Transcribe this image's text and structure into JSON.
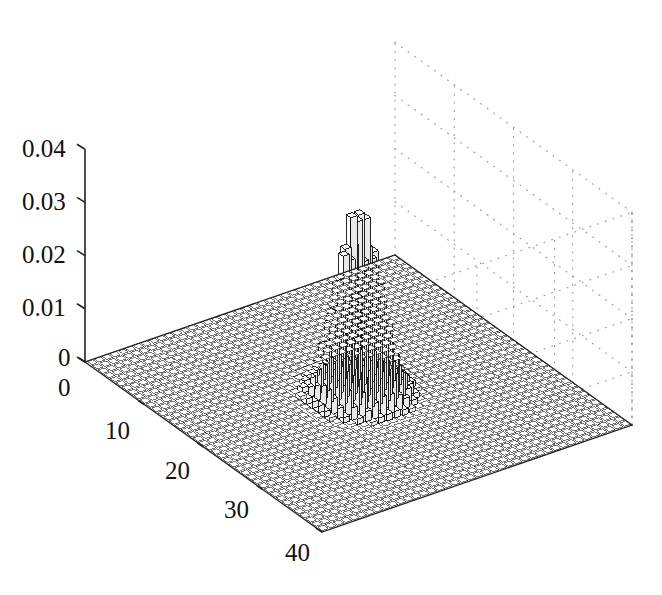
{
  "figure": {
    "type": "3d-bar-plot",
    "background_color": "#ffffff",
    "bar_face_color": "#ffffff",
    "bar_edge_color": "#000000",
    "grid_color": "#9a9a9a",
    "axis_color": "#222222"
  },
  "axes": {
    "z": {
      "ticks": [
        "0",
        "0.01",
        "0.02",
        "0.03",
        "0.04"
      ],
      "tick_values": [
        0,
        0.01,
        0.02,
        0.03,
        0.04
      ],
      "range": [
        0,
        0.04
      ]
    },
    "x": {
      "ticks": [
        "0",
        "10",
        "20",
        "30",
        "40"
      ],
      "tick_values": [
        0,
        10,
        20,
        30,
        40
      ],
      "range": [
        0,
        40
      ]
    },
    "y": {
      "ticks": [],
      "range": [
        0,
        40
      ]
    }
  },
  "labels": {
    "z_0": "0",
    "z_001": "0.01",
    "z_002": "0.02",
    "z_003": "0.03",
    "z_004": "0.04",
    "x_0": "0",
    "x_10": "10",
    "x_20": "20",
    "x_30": "30",
    "x_40": "40"
  },
  "chart_data": {
    "type": "bar",
    "subtype": "bar3-surface",
    "title": "",
    "xlabel": "",
    "ylabel": "",
    "zlabel": "",
    "grid": true,
    "legend": null,
    "xlim": [
      0,
      40
    ],
    "ylim": [
      0,
      40
    ],
    "zlim": [
      0,
      0.04
    ],
    "grid_size": [
      40,
      40
    ],
    "peak": {
      "x": 20,
      "y": 20,
      "value": 0.0352
    },
    "distribution": "gaussian-peak",
    "sigma": 2.1,
    "baseline": 0.00012,
    "categories_x": [
      1,
      2,
      3,
      4,
      5,
      6,
      7,
      8,
      9,
      10,
      11,
      12,
      13,
      14,
      15,
      16,
      17,
      18,
      19,
      20,
      21,
      22,
      23,
      24,
      25,
      26,
      27,
      28,
      29,
      30,
      31,
      32,
      33,
      34,
      35,
      36,
      37,
      38,
      39,
      40
    ],
    "categories_y": [
      1,
      2,
      3,
      4,
      5,
      6,
      7,
      8,
      9,
      10,
      11,
      12,
      13,
      14,
      15,
      16,
      17,
      18,
      19,
      20,
      21,
      22,
      23,
      24,
      25,
      26,
      27,
      28,
      29,
      30,
      31,
      32,
      33,
      34,
      35,
      36,
      37,
      38,
      39,
      40
    ],
    "peak_profile_x": [
      {
        "x": 14,
        "z": 0.0002
      },
      {
        "x": 15,
        "z": 0.0005
      },
      {
        "x": 16,
        "z": 0.0014
      },
      {
        "x": 17,
        "z": 0.0036
      },
      {
        "x": 18,
        "z": 0.0086
      },
      {
        "x": 19,
        "z": 0.0185
      },
      {
        "x": 20,
        "z": 0.0352
      },
      {
        "x": 21,
        "z": 0.0185
      },
      {
        "x": 22,
        "z": 0.0086
      },
      {
        "x": 23,
        "z": 0.0036
      },
      {
        "x": 24,
        "z": 0.0014
      },
      {
        "x": 25,
        "z": 0.0005
      },
      {
        "x": 26,
        "z": 0.0002
      }
    ]
  },
  "view": {
    "azimuth_deg": -37.5,
    "elevation_deg": 30
  }
}
